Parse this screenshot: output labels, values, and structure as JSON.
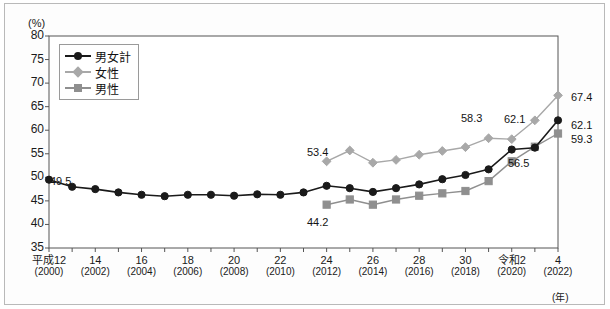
{
  "axis": {
    "unit_label": "(%)",
    "year_unit_label": "(年)",
    "y_ticks": [
      "80",
      "75",
      "70",
      "65",
      "60",
      "55",
      "50",
      "45",
      "40",
      "35"
    ],
    "x_labels": [
      {
        "era": "平成12",
        "year": "(2000)"
      },
      {
        "era": "14",
        "year": "(2002)"
      },
      {
        "era": "16",
        "year": "(2004)"
      },
      {
        "era": "18",
        "year": "(2006)"
      },
      {
        "era": "20",
        "year": "(2008)"
      },
      {
        "era": "22",
        "year": "(2010)"
      },
      {
        "era": "24",
        "year": "(2012)"
      },
      {
        "era": "26",
        "year": "(2014)"
      },
      {
        "era": "28",
        "year": "(2016)"
      },
      {
        "era": "30",
        "year": "(2018)"
      },
      {
        "era": "令和2",
        "year": "(2020)"
      },
      {
        "era": "4",
        "year": "(2022)"
      }
    ]
  },
  "legend": {
    "items": [
      {
        "label": "男女計",
        "color": "#1a1a1a",
        "marker": "circle"
      },
      {
        "label": "女性",
        "color": "#a8a8a8",
        "marker": "diamond"
      },
      {
        "label": "男性",
        "color": "#8f8f8f",
        "marker": "square"
      }
    ]
  },
  "annotations": [
    {
      "text": "49.5",
      "x": 50,
      "y": 175,
      "name": "label-total-2000"
    },
    {
      "text": "53.4",
      "x": 307,
      "y": 146,
      "name": "label-female-2012"
    },
    {
      "text": "44.2",
      "x": 307,
      "y": 216,
      "name": "label-male-2012"
    },
    {
      "text": "58.3",
      "x": 461,
      "y": 112,
      "name": "label-female-2019"
    },
    {
      "text": "62.1",
      "x": 504,
      "y": 113,
      "name": "label-female-2021"
    },
    {
      "text": "56.5",
      "x": 508,
      "y": 157,
      "name": "label-male-2021"
    },
    {
      "text": "67.4",
      "x": 571,
      "y": 91,
      "name": "label-female-2022"
    },
    {
      "text": "62.1",
      "x": 571,
      "y": 119,
      "name": "label-total-2022"
    },
    {
      "text": "59.3",
      "x": 571,
      "y": 133,
      "name": "label-male-2022"
    }
  ],
  "chart_data": {
    "type": "line",
    "title": "",
    "xlabel": "(年)",
    "ylabel": "(%)",
    "ylim": [
      35,
      80
    ],
    "ytick_step": 5,
    "grid": false,
    "legend_position": "top-left",
    "x": [
      2000,
      2001,
      2002,
      2003,
      2004,
      2005,
      2006,
      2007,
      2008,
      2009,
      2010,
      2011,
      2012,
      2013,
      2014,
      2015,
      2016,
      2017,
      2018,
      2019,
      2020,
      2021,
      2022
    ],
    "series": [
      {
        "name": "男女計",
        "color": "#1a1a1a",
        "marker": "circle",
        "values": [
          49.5,
          48.0,
          47.5,
          46.8,
          46.3,
          46.0,
          46.3,
          46.3,
          46.1,
          46.4,
          46.3,
          46.8,
          48.2,
          47.7,
          46.9,
          47.7,
          48.5,
          49.6,
          50.5,
          51.7,
          55.9,
          56.3,
          62.1
        ]
      },
      {
        "name": "女性",
        "color": "#a8a8a8",
        "marker": "diamond",
        "values": [
          null,
          null,
          null,
          null,
          null,
          null,
          null,
          null,
          null,
          null,
          null,
          null,
          53.4,
          55.7,
          53.1,
          53.7,
          54.8,
          55.6,
          56.4,
          58.3,
          58.1,
          62.1,
          67.4
        ]
      },
      {
        "name": "男性",
        "color": "#8f8f8f",
        "marker": "square",
        "values": [
          null,
          null,
          null,
          null,
          null,
          null,
          null,
          null,
          null,
          null,
          null,
          null,
          44.2,
          45.3,
          44.2,
          45.3,
          46.1,
          46.6,
          47.1,
          49.2,
          53.4,
          56.5,
          59.3
        ]
      }
    ]
  }
}
